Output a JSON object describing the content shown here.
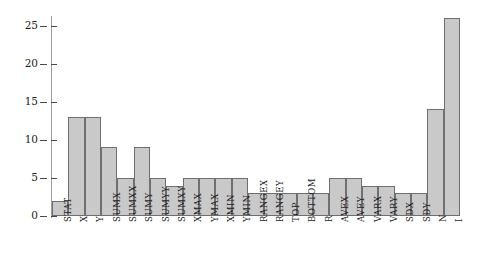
{
  "chart_data": {
    "type": "bar",
    "title": "",
    "subtitle": "",
    "xlabel": "",
    "ylabel": "",
    "xlim": [
      0,
      25
    ],
    "ylim": [
      0,
      26
    ],
    "grid": false,
    "legend": "none",
    "yticks": [
      0,
      5,
      10,
      15,
      20,
      25
    ],
    "ytick_labels": [
      "0",
      "5",
      "10",
      "15",
      "20",
      "25"
    ],
    "categories": [
      "STAT",
      "X",
      "Y",
      "SUMX",
      "SUMXX",
      "SUMY",
      "SUMYY",
      "SUMXY",
      "XMAX",
      "YMAX",
      "XMIN",
      "YMIN",
      "RANGEX",
      "RANGEY",
      "TOP",
      "BOTTOM",
      "R",
      "AVEX",
      "AVEY",
      "VARX",
      "VARY",
      "SDX",
      "SDY",
      "N",
      "I"
    ],
    "values": [
      2,
      13,
      13,
      9,
      5,
      9,
      5,
      4,
      5,
      5,
      5,
      5,
      3,
      3,
      3,
      3,
      3,
      5,
      5,
      4,
      4,
      3,
      3,
      14,
      26
    ],
    "bar_color": "#c9c9c9",
    "bar_edge_color": "#6f6f6f",
    "axis_color": "#9a9a9a",
    "text_color": "#1c1c1c"
  }
}
